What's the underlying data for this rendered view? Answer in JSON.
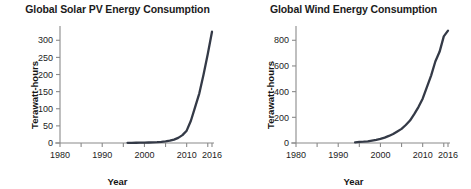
{
  "figure": {
    "background": "#ffffff",
    "series_color": "#343a47",
    "axis_color": "#8a8a8a",
    "text_color": "#1b1b1b"
  },
  "charts": [
    {
      "id": "solar",
      "title": "Global Solar PV Energy Consumption",
      "xlabel": "Year",
      "ylabel": "Terawatt-hours",
      "yticks": [
        "0",
        "50",
        "100",
        "150",
        "200",
        "250",
        "300"
      ],
      "xticks": [
        "1980",
        "1990",
        "2000",
        "2010",
        "2016"
      ]
    },
    {
      "id": "wind",
      "title": "Global Wind Energy Consumption",
      "xlabel": "Year",
      "ylabel": "Terawatt-hours",
      "yticks": [
        "0",
        "200",
        "400",
        "600",
        "800"
      ],
      "xticks": [
        "1980",
        "1990",
        "2000",
        "2010",
        "2016"
      ]
    }
  ],
  "chart_data": [
    {
      "type": "line",
      "title": "Global Solar PV Energy Consumption",
      "xlabel": "Year",
      "ylabel": "Terawatt-hours",
      "xlim": [
        1980,
        2016
      ],
      "ylim": [
        0,
        330
      ],
      "xticks": [
        1980,
        1990,
        2000,
        2010,
        2016
      ],
      "yticks": [
        0,
        50,
        100,
        150,
        200,
        250,
        300
      ],
      "minor_xtick_step": 5,
      "grid": false,
      "legend": "none",
      "series": [
        {
          "name": "Solar PV",
          "color": "#343a47",
          "x": [
            1996,
            1997,
            1998,
            1999,
            2000,
            2001,
            2002,
            2003,
            2004,
            2005,
            2006,
            2007,
            2008,
            2009,
            2010,
            2011,
            2012,
            2013,
            2014,
            2015,
            2016
          ],
          "values": [
            0.5,
            0.6,
            0.7,
            0.9,
            1.1,
            1.4,
            1.8,
            2.4,
            3.4,
            4.8,
            6.8,
            10,
            15,
            23,
            36,
            65,
            105,
            145,
            200,
            260,
            325
          ]
        }
      ]
    },
    {
      "type": "line",
      "title": "Global Wind Energy Consumption",
      "xlabel": "Year",
      "ylabel": "Terawatt-hours",
      "xlim": [
        1980,
        2016
      ],
      "ylim": [
        0,
        880
      ],
      "xticks": [
        1980,
        1990,
        2000,
        2010,
        2016
      ],
      "yticks": [
        0,
        200,
        400,
        600,
        800
      ],
      "minor_xtick_step": 5,
      "grid": false,
      "legend": "none",
      "series": [
        {
          "name": "Wind",
          "color": "#343a47",
          "x": [
            1994,
            1995,
            1996,
            1997,
            1998,
            1999,
            2000,
            2001,
            2002,
            2003,
            2004,
            2005,
            2006,
            2007,
            2008,
            2009,
            2010,
            2011,
            2012,
            2013,
            2014,
            2015,
            2016
          ],
          "values": [
            5,
            8,
            10,
            13,
            19,
            25,
            32,
            42,
            55,
            70,
            90,
            110,
            140,
            175,
            225,
            280,
            345,
            435,
            525,
            635,
            710,
            830,
            875
          ]
        }
      ]
    }
  ]
}
